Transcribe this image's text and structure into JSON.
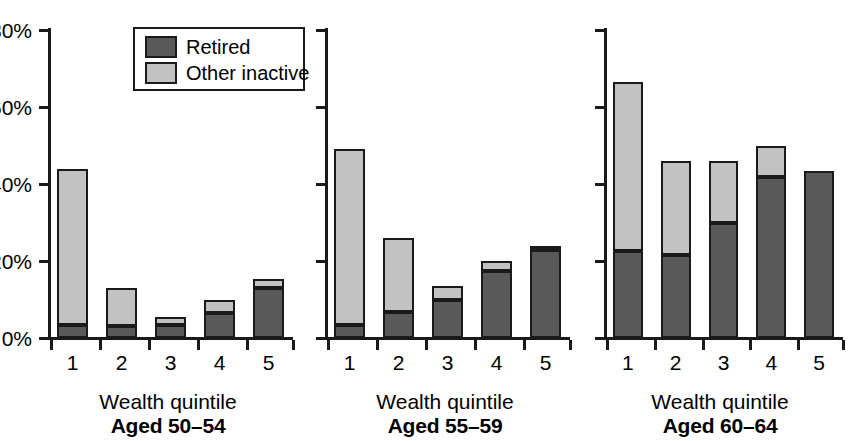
{
  "chart_data": {
    "type": "bar",
    "title": "",
    "subtitle": "",
    "stacked": true,
    "xlabel": "Wealth quintile",
    "ylabel": "",
    "ylim": [
      0,
      80
    ],
    "ytick_labels": [
      "0%",
      "20%",
      "40%",
      "60%",
      "80%"
    ],
    "ytick_values": [
      0,
      20,
      40,
      60,
      80
    ],
    "grid": false,
    "legend_position": "top-left-inside-panel-1",
    "legend": [
      {
        "name": "Retired",
        "color": "#59595a"
      },
      {
        "name": "Other inactive",
        "color": "#c2c2c2"
      }
    ],
    "categories": [
      "1",
      "2",
      "3",
      "4",
      "5"
    ],
    "panels": [
      {
        "id": "aged-50-54",
        "xlabel": "Wealth quintile",
        "caption": "Aged 50–54",
        "categories": [
          "1",
          "2",
          "3",
          "4",
          "5"
        ],
        "series": [
          {
            "name": "Retired",
            "color": "#59595a",
            "values": [
              3.5,
              3.0,
              3.5,
              6.5,
              13.0
            ]
          },
          {
            "name": "Other inactive",
            "color": "#c2c2c2",
            "values": [
              40.5,
              10.0,
              2.0,
              3.5,
              2.3
            ]
          }
        ],
        "totals": [
          44.0,
          13.0,
          5.5,
          10.0,
          15.3
        ]
      },
      {
        "id": "aged-55-59",
        "xlabel": "Wealth quintile",
        "caption": "Aged 55–59",
        "categories": [
          "1",
          "2",
          "3",
          "4",
          "5"
        ],
        "series": [
          {
            "name": "Retired",
            "color": "#59595a",
            "values": [
              3.5,
              6.8,
              10.0,
              17.4,
              22.8
            ]
          },
          {
            "name": "Other inactive",
            "color": "#c2c2c2",
            "values": [
              45.5,
              19.2,
              3.5,
              2.6,
              1.2
            ]
          }
        ],
        "totals": [
          49.0,
          26.0,
          13.5,
          20.0,
          24.0
        ]
      },
      {
        "id": "aged-60-64",
        "xlabel": "Wealth quintile",
        "caption": "Aged 60–64",
        "categories": [
          "1",
          "2",
          "3",
          "4",
          "5"
        ],
        "series": [
          {
            "name": "Retired",
            "color": "#59595a",
            "values": [
              22.7,
              21.5,
              30.0,
              41.8,
              43.5
            ]
          },
          {
            "name": "Other inactive",
            "color": "#c2c2c2",
            "values": [
              43.8,
              24.5,
              16.0,
              8.2,
              0.0
            ]
          }
        ],
        "totals": [
          66.5,
          46.0,
          46.0,
          50.0,
          43.5
        ]
      }
    ]
  },
  "axis": {
    "ytick_labels": [
      "80%",
      "60%",
      "40%",
      "20%",
      "0%"
    ],
    "xtick_labels": [
      "1",
      "2",
      "3",
      "4",
      "5"
    ]
  },
  "legend": {
    "retired_label": "Retired",
    "other_inactive_label": "Other inactive"
  },
  "panels": {
    "p1": {
      "xlabel": "Wealth quintile",
      "caption": "Aged 50–54"
    },
    "p2": {
      "xlabel": "Wealth quintile",
      "caption": "Aged 55–59"
    },
    "p3": {
      "xlabel": "Wealth quintile",
      "caption": "Aged 60–64"
    }
  },
  "colors": {
    "retired": "#59595a",
    "other_inactive": "#c2c2c2",
    "ink": "#1a1a1a",
    "background": "#ffffff"
  }
}
